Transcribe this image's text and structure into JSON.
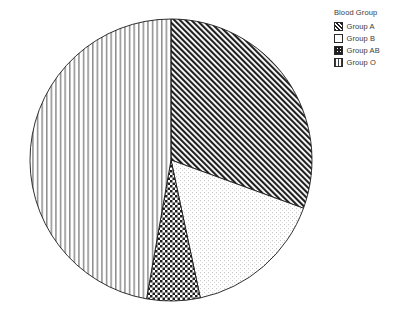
{
  "chart_data": {
    "type": "pie",
    "title": "",
    "legend_title": "Blood Group",
    "legend_position": "top-right",
    "grid": false,
    "categories": [
      "Group A",
      "Group B",
      "Group AB",
      "Group O"
    ],
    "values": [
      30.6,
      16.1,
      6.1,
      47.2
    ],
    "units": "percent",
    "start_angle_deg": 0,
    "direction": "clockwise",
    "slices": [
      {
        "label": "Group A",
        "value": 30.6,
        "start_angle_deg": 0,
        "end_angle_deg": 110,
        "pattern": "diagonal-hatch-dense",
        "fill": "#ffffff",
        "stroke": "#1a1a1a"
      },
      {
        "label": "Group B",
        "value": 16.1,
        "start_angle_deg": 110,
        "end_angle_deg": 168,
        "pattern": "sparse-dots",
        "fill": "#ffffff",
        "stroke": "#1a1a1a"
      },
      {
        "label": "Group AB",
        "value": 6.1,
        "start_angle_deg": 168,
        "end_angle_deg": 190,
        "pattern": "checkerboard-crosshatch",
        "fill": "#ffffff",
        "stroke": "#1a1a1a"
      },
      {
        "label": "Group O",
        "value": 47.2,
        "start_angle_deg": 190,
        "end_angle_deg": 360,
        "pattern": "vertical-lines",
        "fill": "#ffffff",
        "stroke": "#1a1a1a"
      }
    ],
    "geometry": {
      "center_x": 171,
      "center_y": 160,
      "radius": 141
    },
    "colors": {
      "outline": "#1a1a1a",
      "pattern": "#1f1f1f",
      "background": "#ffffff",
      "text": "#3b3b3b"
    }
  },
  "legend": {
    "title": "Blood Group",
    "items": [
      {
        "label": "Group A",
        "pattern": "diagonal-hatch-dense"
      },
      {
        "label": "Group B",
        "pattern": "sparse-dots"
      },
      {
        "label": "Group AB",
        "pattern": "checkerboard-crosshatch"
      },
      {
        "label": "Group O",
        "pattern": "vertical-lines"
      }
    ]
  }
}
